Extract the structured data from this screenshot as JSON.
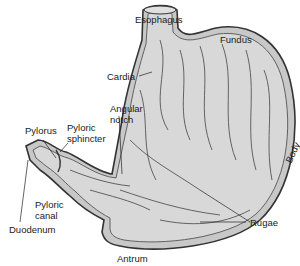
{
  "diagram": {
    "labels": {
      "esophagus": "Esophagus",
      "fundus": "Fundus",
      "cardia": "Cardia",
      "angular_notch_1": "Angular",
      "angular_notch_2": "notch",
      "pylorus": "Pylorus",
      "pyloric_sphincter_1": "Pyloric",
      "pyloric_sphincter_2": "sphincter",
      "pyloric_canal_1": "Pyloric",
      "pyloric_canal_2": "canal",
      "duodenum": "Duodenum",
      "body": "Body",
      "rugae": "Rugae",
      "antrum": "Antrum"
    },
    "colors": {
      "fill": "#d4d4d4",
      "outline": "#3a3a3a",
      "text": "#1a1a1a"
    }
  }
}
